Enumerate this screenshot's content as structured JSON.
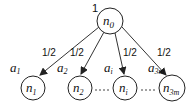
{
  "diagram": {
    "type": "tree",
    "root": {
      "id": "n0",
      "label": "n",
      "sub": "0",
      "weight": "1"
    },
    "children": [
      {
        "id": "n1",
        "label": "n",
        "sub": "1",
        "edge_label": "1/2",
        "a_label": "a",
        "a_sub": "1"
      },
      {
        "id": "n2",
        "label": "n",
        "sub": "2",
        "edge_label": "1/2",
        "a_label": "a",
        "a_sub": "2"
      },
      {
        "id": "ni",
        "label": "n",
        "sub": "i",
        "edge_label": "1/2",
        "a_label": "a",
        "a_sub": "i"
      },
      {
        "id": "n3m",
        "label": "n",
        "sub": "3m",
        "edge_label": "1/2",
        "a_label": "a",
        "a_sub": "3m"
      }
    ],
    "ellipsis": [
      "- - -",
      "- - -"
    ]
  }
}
